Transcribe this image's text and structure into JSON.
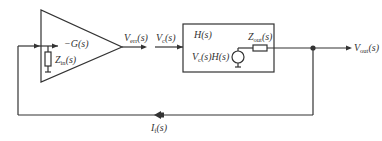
{
  "diagram": {
    "type": "block-diagram",
    "amplifier": {
      "gain_label": "−G(s)",
      "input_impedance": {
        "symbol": "Z",
        "sub": "in",
        "arg": "(s)"
      }
    },
    "error_signal": {
      "symbol": "V",
      "sub": "err",
      "arg": "(s)"
    },
    "control_signal": {
      "symbol": "V",
      "sub": "c",
      "arg": "(s)"
    },
    "plant_block": {
      "title": "H(s)",
      "source_label": {
        "symbol": "V",
        "sub": "c",
        "arg": "(s)H(s)"
      },
      "output_impedance": {
        "symbol": "Z",
        "sub": "out",
        "arg": "(s)"
      }
    },
    "output": {
      "symbol": "V",
      "sub": "out",
      "arg": "(s)"
    },
    "feedback_current": {
      "symbol": "I",
      "sub": "f",
      "arg": "(s)"
    },
    "colors": {
      "stroke": "#333333",
      "text": "#333333",
      "background": "#ffffff"
    }
  }
}
